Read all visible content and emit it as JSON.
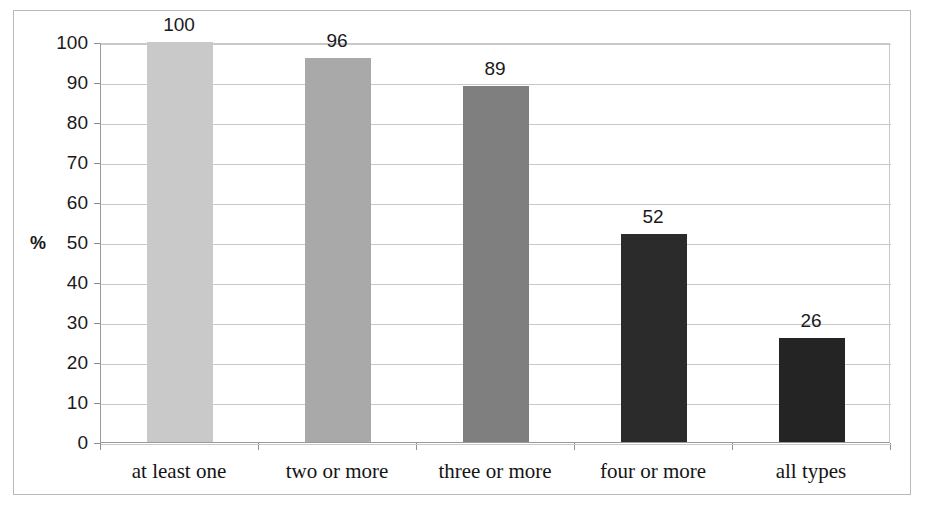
{
  "chart_data": {
    "type": "bar",
    "title": "",
    "xlabel": "",
    "ylabel": "%",
    "categories": [
      "at least one",
      "two or more",
      "three or more",
      "four or more",
      "all types"
    ],
    "values": [
      100,
      96,
      89,
      52,
      26
    ],
    "value_labels": [
      "100",
      "96",
      "89",
      "52",
      "26"
    ],
    "ylim": [
      0,
      100
    ],
    "yticks": [
      0,
      10,
      20,
      30,
      40,
      50,
      60,
      70,
      80,
      90,
      100
    ],
    "ytick_labels": [
      "0",
      "10",
      "20",
      "30",
      "40",
      "50",
      "60",
      "70",
      "80",
      "90",
      "100"
    ],
    "grid": "horizontal",
    "legend": "none",
    "bar_colors": [
      "#c9c9c9",
      "#a9a9a9",
      "#7f7f7f",
      "#2b2b2b",
      "#242424"
    ],
    "gridline_color": "#c9c9c9",
    "axis_color": "#8f8f8f",
    "frame_color": "#b9b9b9",
    "text_color": "#1a1a1a"
  }
}
